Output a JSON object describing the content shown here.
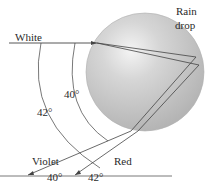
{
  "diagram": {
    "labels": {
      "incident_light": "White",
      "drop_line1": "Rain",
      "drop_line2": "drop",
      "violet": "Violet",
      "red": "Red",
      "arc_inner_angle": "40°",
      "arc_outer_angle": "42°",
      "ground_violet_angle": "40°",
      "ground_red_angle": "42°"
    },
    "colors": {
      "line": "#444444",
      "drop_fill": "#c8c8c8",
      "drop_highlight": "#f2f2f2",
      "drop_edge": "#a8a8a8",
      "text": "#2a2a2a"
    }
  }
}
